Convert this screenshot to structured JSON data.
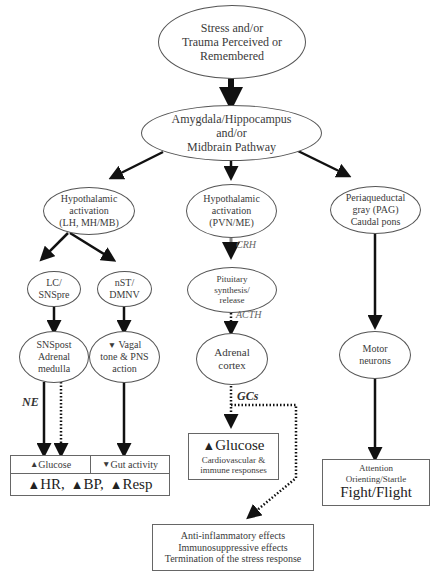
{
  "diagram": {
    "type": "flowchart",
    "nodes": {
      "stress": {
        "lines": [
          "Stress and/or",
          "Trauma Perceived or",
          "Remembered"
        ]
      },
      "amygdala": {
        "lines": [
          "Amygdala/Hippocampus",
          "and/or",
          "Midbrain Pathway"
        ]
      },
      "hypo_left": {
        "lines": [
          "Hypothalamic",
          "activation",
          "(LH, MH/MB)"
        ]
      },
      "hypo_mid": {
        "lines": [
          "Hypothalamic",
          "activation",
          "(PVN/ME)"
        ]
      },
      "pag": {
        "lines": [
          "Periaqueductal",
          "gray (PAG)",
          "Caudal pons"
        ]
      },
      "lc": {
        "lines": [
          "LC/",
          "SNSpre"
        ]
      },
      "nst": {
        "lines": [
          "nST/",
          "DMNV"
        ]
      },
      "pituitary": {
        "lines": [
          "Pituitary",
          "synthesis/",
          "release"
        ]
      },
      "snspost": {
        "lines": [
          "SNSpost",
          "Adrenal",
          "medulla"
        ]
      },
      "vagal": {
        "arrow": "▼",
        "lines": [
          "Vagal",
          "tone & PNS",
          "action"
        ]
      },
      "adrenal_cortex": {
        "lines": [
          "Adrenal",
          "cortex"
        ]
      },
      "motor": {
        "lines": [
          "Motor",
          "neurons"
        ]
      },
      "glucose_left": {
        "arrow": "▲",
        "text": "Glucose"
      },
      "gut": {
        "arrow": "▼",
        "text": "Gut activity"
      },
      "vitals": {
        "items": [
          {
            "arrow": "▲",
            "text": "HR,"
          },
          {
            "arrow": "▲",
            "text": "BP,"
          },
          {
            "arrow": "▲",
            "text": "Resp"
          }
        ]
      },
      "glucose_mid": {
        "arrow": "▲",
        "title": "Glucose",
        "lines": [
          "Cardiovascular &",
          "immune responses"
        ]
      },
      "attention": {
        "lines": [
          "Attention",
          "Orienting/Startle"
        ],
        "title": "Fight/Flight"
      },
      "anti_inflam": {
        "lines": [
          "Anti-inflammatory effects",
          "Immunosuppressive effects",
          "Termination of the stress response"
        ]
      }
    },
    "edge_labels": {
      "ne": "NE",
      "crh": "CRH",
      "acth": "ACTH",
      "gcs": "GCs"
    },
    "colors": {
      "line": "#111111",
      "crh_line": "#888888",
      "border": "#555555",
      "text": "#3a3a3a"
    }
  }
}
